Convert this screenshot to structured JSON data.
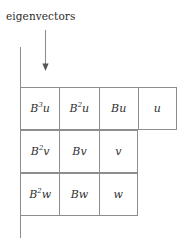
{
  "figure": {
    "caption": "eigenvectors",
    "arrow": {
      "name": "down-arrow",
      "direction": "down"
    },
    "axis": {
      "name": "vertical-axis-line"
    },
    "colors": {
      "background": "#ffffff",
      "grid_line": "#8d8d8d",
      "text": "#303030",
      "caption_text": "#2b2b2b"
    },
    "grid": {
      "rows": [
        {
          "cells": [
            {
              "base": "B",
              "exponent": "3",
              "vector": "u",
              "text": "B3u"
            },
            {
              "base": "B",
              "exponent": "2",
              "vector": "u",
              "text": "B2u"
            },
            {
              "base": "B",
              "exponent": "",
              "vector": "u",
              "text": "Bu"
            },
            {
              "base": "",
              "exponent": "",
              "vector": "u",
              "text": "u"
            }
          ]
        },
        {
          "cells": [
            {
              "base": "B",
              "exponent": "2",
              "vector": "v",
              "text": "B2v"
            },
            {
              "base": "B",
              "exponent": "",
              "vector": "v",
              "text": "Bv"
            },
            {
              "base": "",
              "exponent": "",
              "vector": "v",
              "text": "v"
            }
          ]
        },
        {
          "cells": [
            {
              "base": "B",
              "exponent": "2",
              "vector": "w",
              "text": "B2w"
            },
            {
              "base": "B",
              "exponent": "",
              "vector": "w",
              "text": "Bw"
            },
            {
              "base": "",
              "exponent": "",
              "vector": "w",
              "text": "w"
            }
          ]
        }
      ]
    }
  }
}
